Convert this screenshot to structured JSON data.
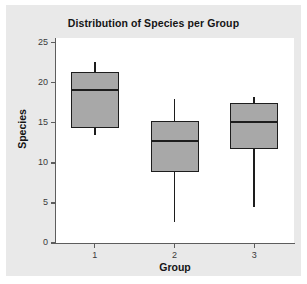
{
  "chart_data": {
    "type": "box",
    "title": "Distribution of Species per Group",
    "xlabel": "Group",
    "ylabel": "Species",
    "categories": [
      "1",
      "2",
      "3"
    ],
    "xtick_labels": [
      "1",
      "2",
      "3"
    ],
    "ytick_labels": [
      "0",
      "5",
      "10",
      "15",
      "20",
      "25"
    ],
    "ytick_values": [
      0,
      5,
      10,
      15,
      20,
      25
    ],
    "ylim": [
      0,
      25.6
    ],
    "grid": false,
    "legend": null,
    "box_fill_color": "#a8a8a8",
    "box_line_color": "#1d1d1d",
    "panel_background": "#ffffff",
    "figure_background": "#e9e9e9",
    "boxes": [
      {
        "group": "1",
        "whisker_low": 13.5,
        "q1": 14.4,
        "median": 19.1,
        "q3": 21.3,
        "whisker_high": 22.6
      },
      {
        "group": "2",
        "whisker_low": 2.6,
        "q1": 8.9,
        "median": 12.7,
        "q3": 15.2,
        "whisker_high": 18.0
      },
      {
        "group": "3",
        "whisker_low": 4.5,
        "q1": 11.7,
        "median": 15.1,
        "q3": 17.5,
        "whisker_high": 18.2
      }
    ]
  }
}
